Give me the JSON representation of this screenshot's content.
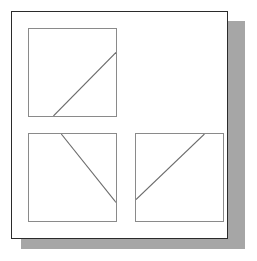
{
  "figure": {
    "background_color": "#ffffff",
    "frame_border_color": "#2b2b2b",
    "panel_border_color": "#8a8a8a",
    "line_color": "#6b6b6b",
    "shadow_color": "#a6a6a6"
  },
  "chart_data": {
    "type": "scatter",
    "xlabel": "",
    "ylabel": "",
    "grid": false,
    "legend": null,
    "outer_frame": {
      "x": 11,
      "y": 11,
      "width": 217,
      "height": 228
    },
    "shadow": {
      "offset_x": 8,
      "offset_y": 10
    },
    "panels": [
      {
        "name": "top-left-panel",
        "position": "top-left",
        "x": 28,
        "y": 28,
        "width": 89,
        "height": 89,
        "line": {
          "direction": "up-right",
          "x1": 25,
          "y1": 89,
          "x2": 89,
          "y2": 24
        }
      },
      {
        "name": "top-right-panel",
        "position": "top-right",
        "empty": true
      },
      {
        "name": "bottom-left-panel",
        "position": "bottom-left",
        "x": 28,
        "y": 133,
        "width": 89,
        "height": 89,
        "line": {
          "direction": "down-right",
          "x1": 33,
          "y1": 0,
          "x2": 89,
          "y2": 70
        }
      },
      {
        "name": "bottom-right-panel",
        "position": "bottom-right",
        "x": 135,
        "y": 133,
        "width": 89,
        "height": 89,
        "line": {
          "direction": "up-right",
          "x1": 0,
          "y1": 67,
          "x2": 70,
          "y2": 0
        }
      }
    ]
  }
}
